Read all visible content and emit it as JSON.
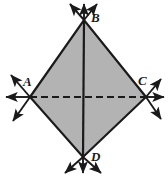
{
  "figure": {
    "kind": "geometry-diagram",
    "width": 168,
    "height": 178,
    "background_color": "#ffffff",
    "fill_color": "#b3b3b3",
    "fill_color_right": "#adadad",
    "stroke_color": "#1a1a1a",
    "label_color": "#1a1a1a",
    "edge_width": 2.2,
    "ray_width": 1.9,
    "dash_pattern": "7,4"
  },
  "vertices": [
    {
      "id": "A",
      "label": "A",
      "x": 30,
      "y": 97,
      "label_x": 23,
      "label_y": 75
    },
    {
      "id": "B",
      "label": "B",
      "x": 84,
      "y": 20,
      "label_x": 91,
      "label_y": 11
    },
    {
      "id": "C",
      "label": "C",
      "x": 146,
      "y": 97,
      "label_x": 138,
      "label_y": 74
    },
    {
      "id": "D",
      "label": "D",
      "x": 83,
      "y": 157,
      "label_x": 91,
      "label_y": 150
    }
  ],
  "polygon": {
    "name": "ABCD",
    "points": "30,97 84,20 146,97 83,157"
  },
  "diagonals": [
    {
      "id": "BD",
      "from": "B",
      "to": "D",
      "style": "solid",
      "x1": 84,
      "y1": 20,
      "x2": 83,
      "y2": 157
    },
    {
      "id": "AC",
      "from": "A",
      "to": "C",
      "style": "dashed",
      "x1": 30,
      "y1": 97,
      "x2": 146,
      "y2": 97
    }
  ],
  "edges": [
    {
      "id": "AB",
      "x1": 30,
      "y1": 97,
      "x2": 84,
      "y2": 20
    },
    {
      "id": "BC",
      "x1": 84,
      "y1": 20,
      "x2": 146,
      "y2": 97
    },
    {
      "id": "CD",
      "x1": 146,
      "y1": 97,
      "x2": 83,
      "y2": 157
    },
    {
      "id": "DA",
      "x1": 83,
      "y1": 157,
      "x2": 30,
      "y2": 97
    }
  ],
  "rays": [
    {
      "id": "ray-A-horizontal-left",
      "vertex": "A",
      "x1": 30,
      "y1": 97,
      "x2": 3,
      "y2": 97,
      "arrow": true
    },
    {
      "id": "ray-A-upper-left",
      "vertex": "A",
      "x1": 30,
      "y1": 97,
      "x2": 8,
      "y2": 72,
      "arrow": true
    },
    {
      "id": "ray-A-lower-left",
      "vertex": "A",
      "x1": 30,
      "y1": 97,
      "x2": 10,
      "y2": 124,
      "arrow": true
    },
    {
      "id": "ray-C-horizontal-right",
      "vertex": "C",
      "x1": 146,
      "y1": 97,
      "x2": 166,
      "y2": 97,
      "arrow": true
    },
    {
      "id": "ray-C-upper-right",
      "vertex": "C",
      "x1": 146,
      "y1": 97,
      "x2": 163,
      "y2": 76,
      "arrow": true
    },
    {
      "id": "ray-C-lower-right",
      "vertex": "C",
      "x1": 146,
      "y1": 97,
      "x2": 164,
      "y2": 122,
      "arrow": true
    },
    {
      "id": "ray-B-vertical-up",
      "vertex": "B",
      "x1": 84,
      "y1": 20,
      "x2": 84,
      "y2": 2,
      "arrow": true
    },
    {
      "id": "ray-B-upper-left",
      "vertex": "B",
      "x1": 84,
      "y1": 20,
      "x2": 68,
      "y2": 2,
      "arrow": true
    },
    {
      "id": "ray-B-upper-right",
      "vertex": "B",
      "x1": 84,
      "y1": 20,
      "x2": 99,
      "y2": 2,
      "arrow": true
    },
    {
      "id": "ray-D-vertical-down",
      "vertex": "D",
      "x1": 83,
      "y1": 157,
      "x2": 83,
      "y2": 175,
      "arrow": true
    },
    {
      "id": "ray-D-lower-left",
      "vertex": "D",
      "x1": 83,
      "y1": 157,
      "x2": 62,
      "y2": 175,
      "arrow": true
    },
    {
      "id": "ray-D-lower-right",
      "vertex": "D",
      "x1": 83,
      "y1": 157,
      "x2": 104,
      "y2": 175,
      "arrow": true
    }
  ]
}
